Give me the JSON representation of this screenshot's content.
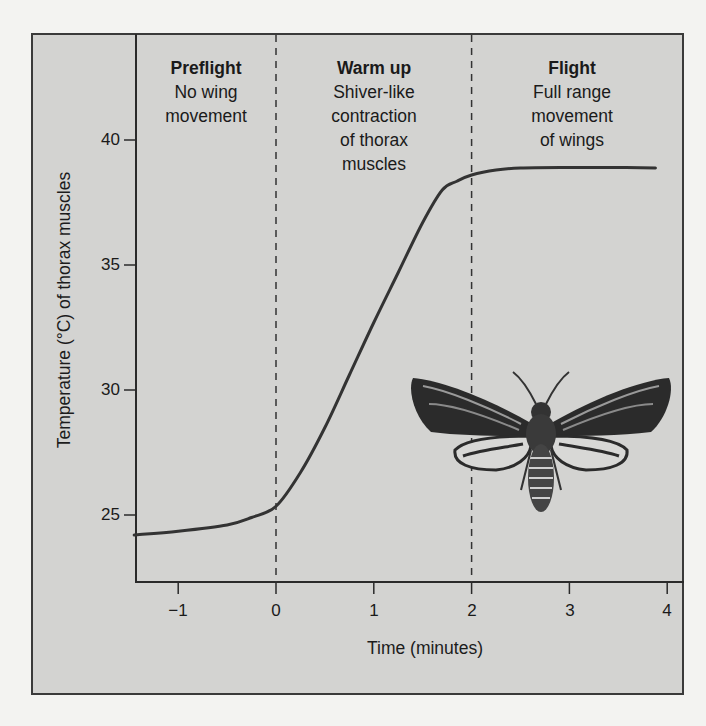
{
  "chart_data": {
    "type": "line",
    "title": "",
    "xlabel": "Time (minutes)",
    "ylabel": "Temperature (°C) of thorax muscles",
    "xlim": [
      -1.45,
      4.2
    ],
    "ylim": [
      22.3,
      44.3
    ],
    "xticks": [
      -1,
      0,
      1,
      2,
      3,
      4
    ],
    "xtick_labels": [
      "−1",
      "0",
      "1",
      "2",
      "3",
      "4"
    ],
    "yticks": [
      25,
      30,
      35,
      40
    ],
    "ytick_labels": [
      "25",
      "30",
      "35",
      "40"
    ],
    "grid": false,
    "legend": null,
    "series": [
      {
        "name": "Thorax muscle temperature",
        "x": [
          -1.45,
          -1.0,
          -0.5,
          -0.25,
          0.0,
          0.25,
          0.5,
          0.75,
          1.0,
          1.25,
          1.5,
          1.7,
          1.85,
          2.0,
          2.25,
          2.5,
          3.0,
          3.5,
          3.88
        ],
        "y": [
          24.2,
          24.35,
          24.6,
          24.9,
          25.35,
          26.7,
          28.5,
          30.6,
          32.7,
          34.7,
          36.7,
          38.0,
          38.35,
          38.6,
          38.8,
          38.88,
          38.9,
          38.9,
          38.88
        ]
      }
    ],
    "vlines": [
      {
        "x": 0,
        "style": "dashed"
      },
      {
        "x": 2,
        "style": "dashed"
      }
    ],
    "annotations": [
      {
        "phase": "Preflight",
        "lines": [
          "No wing",
          "movement"
        ],
        "x_range": [
          -1.45,
          0
        ]
      },
      {
        "phase": "Warm up",
        "lines": [
          "Shiver-like",
          "contraction",
          "of thorax",
          "muscles"
        ],
        "x_range": [
          0,
          2
        ]
      },
      {
        "phase": "Flight",
        "lines": [
          "Full range",
          "movement",
          "of wings"
        ],
        "x_range": [
          2,
          4.2
        ]
      }
    ],
    "image_inset": "moth illustration (sphinx/hawk moth, wings spread) in lower right of plot area"
  },
  "colors": {
    "frame_bg": "#d3d3d1",
    "page_bg": "#f3f3f1",
    "curve": "#333333",
    "axis": "#2a2a2a"
  },
  "icons": {
    "inset": "moth-illustration"
  }
}
